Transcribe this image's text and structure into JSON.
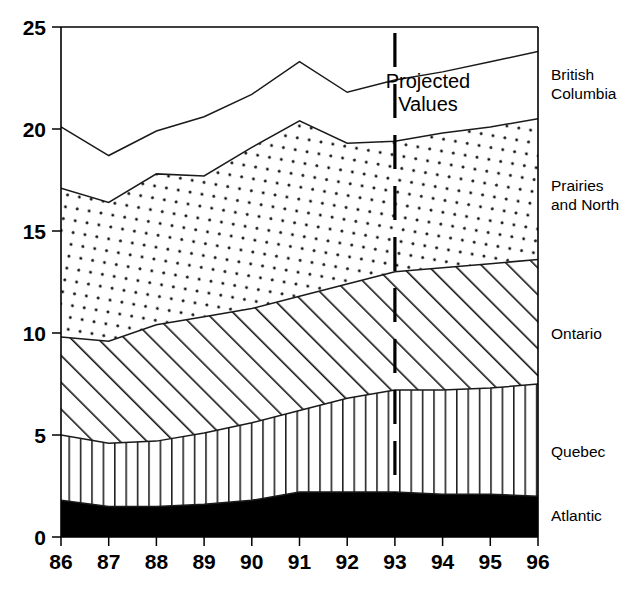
{
  "chart_data": {
    "type": "area",
    "title": "",
    "subtitle": "",
    "xlabel": "",
    "ylabel": "",
    "stacked": true,
    "grid": false,
    "legend_position": "right-inline",
    "xlim": [
      86,
      96
    ],
    "ylim": [
      0,
      25
    ],
    "yticks": [
      0,
      5,
      10,
      15,
      20,
      25
    ],
    "ytick_labels": [
      "0",
      "5",
      "10",
      "15",
      "20",
      "25"
    ],
    "categories": [
      "86",
      "87",
      "88",
      "89",
      "90",
      "91",
      "92",
      "93",
      "94",
      "95",
      "96"
    ],
    "x": [
      86,
      87,
      88,
      89,
      90,
      91,
      92,
      93,
      94,
      95,
      96
    ],
    "series": [
      {
        "name": "Atlantic",
        "fill": "solid-black",
        "values": [
          1.8,
          1.5,
          1.5,
          1.6,
          1.8,
          2.2,
          2.2,
          2.2,
          2.1,
          2.1,
          2.0
        ],
        "cumulative": [
          1.8,
          1.5,
          1.5,
          1.6,
          1.8,
          2.2,
          2.2,
          2.2,
          2.1,
          2.1,
          2.0
        ]
      },
      {
        "name": "Quebec",
        "fill": "vertical-lines",
        "values": [
          3.2,
          3.1,
          3.2,
          3.5,
          3.8,
          4.0,
          4.6,
          5.0,
          5.1,
          5.2,
          5.5
        ],
        "cumulative": [
          5.0,
          4.6,
          4.7,
          5.1,
          5.6,
          6.2,
          6.8,
          7.2,
          7.2,
          7.3,
          7.5
        ]
      },
      {
        "name": "Ontario",
        "fill": "diagonal-hatch",
        "values": [
          4.8,
          5.0,
          5.7,
          5.7,
          5.6,
          5.6,
          5.6,
          5.8,
          6.0,
          6.1,
          6.1
        ],
        "cumulative": [
          9.8,
          9.6,
          10.4,
          10.8,
          11.2,
          11.8,
          12.4,
          13.0,
          13.2,
          13.4,
          13.6
        ]
      },
      {
        "name": "Prairies and North",
        "fill": "dotted",
        "values": [
          7.3,
          6.8,
          7.4,
          6.9,
          7.9,
          8.6,
          6.9,
          6.4,
          6.6,
          6.7,
          6.9
        ],
        "cumulative": [
          17.1,
          16.4,
          17.8,
          17.7,
          19.1,
          20.4,
          19.3,
          19.4,
          19.8,
          20.1,
          20.5
        ]
      },
      {
        "name": "British Columbia",
        "fill": "none-white",
        "values": [
          3.0,
          2.3,
          2.1,
          2.9,
          2.6,
          2.9,
          2.5,
          3.0,
          3.0,
          3.2,
          3.3
        ],
        "cumulative": [
          20.1,
          18.7,
          19.9,
          20.6,
          21.7,
          23.3,
          21.8,
          22.4,
          22.8,
          23.3,
          23.8
        ]
      }
    ],
    "annotations": [
      {
        "name": "projected-values",
        "line1": "Projected",
        "line2": "Values",
        "at_x": 93,
        "type": "text-with-divider"
      }
    ],
    "divider": {
      "name": "projection-divider",
      "x": 93,
      "style": "dashed",
      "label": "93"
    }
  },
  "legend": {
    "items": [
      {
        "label_line1": "British",
        "label_line2": "Columbia",
        "name": "british-columbia"
      },
      {
        "label_line1": "Prairies",
        "label_line2": "and North",
        "name": "prairies-and-north"
      },
      {
        "label_line1": "Ontario",
        "label_line2": "",
        "name": "ontario"
      },
      {
        "label_line1": "Quebec",
        "label_line2": "",
        "name": "quebec"
      },
      {
        "label_line1": "Atlantic",
        "label_line2": "",
        "name": "atlantic"
      }
    ]
  },
  "axes": {
    "y_labels": [
      "25",
      "20",
      "15",
      "10",
      "5",
      "0"
    ],
    "x_labels": [
      "86",
      "87",
      "88",
      "89",
      "90",
      "91",
      "92",
      "93",
      "94",
      "95",
      "96"
    ]
  },
  "colors": {
    "ink": "#000000",
    "background": "#ffffff",
    "atlantic_fill": "#000000",
    "pattern_stroke": "#1a1a1a"
  }
}
